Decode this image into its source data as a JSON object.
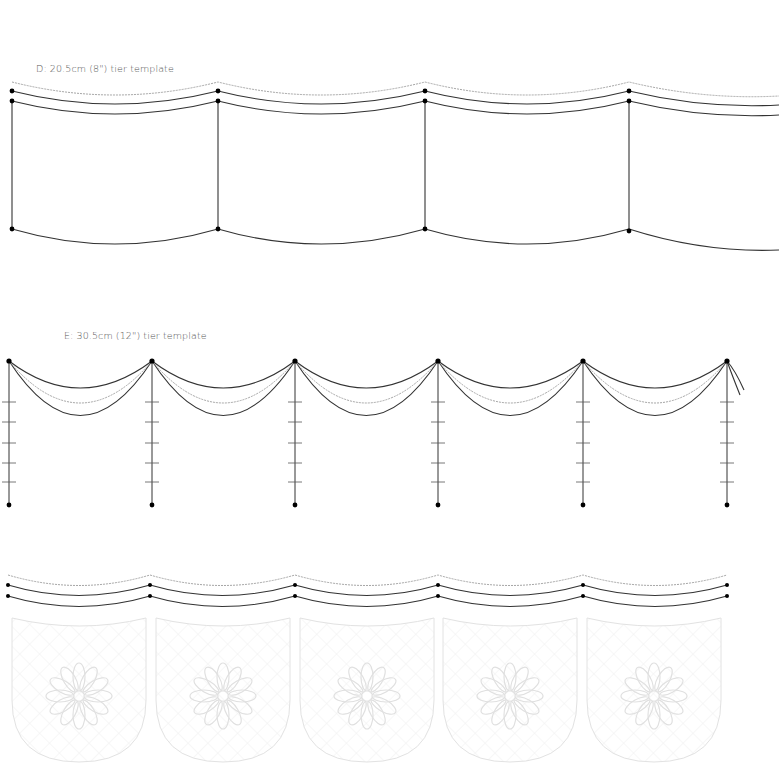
{
  "templates": [
    {
      "id": "D",
      "label": "D: 20.5cm (8\") tier template"
    },
    {
      "id": "E",
      "label": "E: 30.5cm (12\") tier template"
    },
    {
      "id": "F",
      "label": ""
    }
  ],
  "colors": {
    "line": "#333333",
    "wavy": "#9a9a9a",
    "faint": "#e4e4e4",
    "dot": "#000000"
  }
}
